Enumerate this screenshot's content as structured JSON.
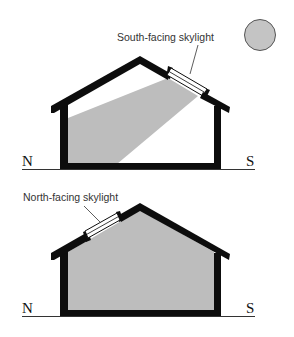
{
  "diagram": {
    "colors": {
      "structure": "#0d0d0d",
      "light": "#bdbdbd",
      "sun_fill": "#c4c4c4",
      "sun_stroke": "#555555",
      "ground": "#333333",
      "label": "#333333"
    },
    "top_panel": {
      "skylight_label": "South-facing skylight",
      "north_label": "N",
      "south_label": "S",
      "sun": "sun-icon"
    },
    "bottom_panel": {
      "skylight_label": "North-facing skylight",
      "north_label": "N",
      "south_label": "S"
    }
  }
}
